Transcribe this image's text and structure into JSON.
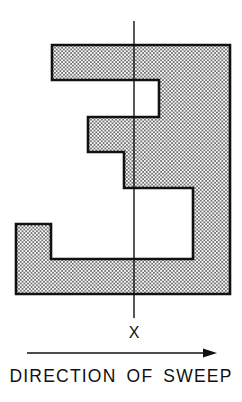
{
  "diagram": {
    "sweep_line_label": "X",
    "caption": "DIRECTION OF SWEEP",
    "polygon": {
      "description": "Stippled (dotted) rectilinear polygon resembling the digit 3",
      "fill_style": "stipple-dots",
      "outline_color": "#111111",
      "vertices": [
        [
          52,
          45
        ],
        [
          230,
          45
        ],
        [
          230,
          294
        ],
        [
          16,
          294
        ],
        [
          16,
          224
        ],
        [
          51,
          224
        ],
        [
          51,
          259
        ],
        [
          193,
          259
        ],
        [
          193,
          188
        ],
        [
          124,
          188
        ],
        [
          124,
          152
        ],
        [
          88,
          152
        ],
        [
          88,
          117
        ],
        [
          159,
          117
        ],
        [
          159,
          80
        ],
        [
          52,
          80
        ]
      ]
    },
    "sweep_line": {
      "x": 134,
      "y_start": 21,
      "y_end": 318
    },
    "arrow": {
      "x_start": 27,
      "x_end": 217,
      "y": 353,
      "direction": "right"
    },
    "colors": {
      "ink": "#111111",
      "background": "#ffffff",
      "stipple": "#333333"
    }
  }
}
